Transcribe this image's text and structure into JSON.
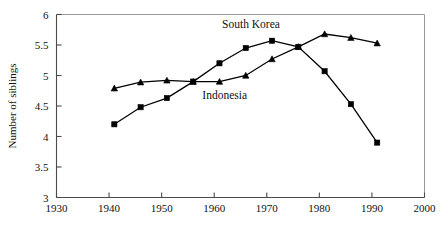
{
  "chart_data": {
    "type": "line",
    "title": "",
    "xlabel": "",
    "ylabel": "Number of siblings",
    "xlim": [
      1930,
      2000
    ],
    "ylim": [
      3,
      6
    ],
    "xticks": [
      1930,
      1940,
      1950,
      1960,
      1970,
      1980,
      1990,
      2000
    ],
    "yticks": [
      3,
      3.5,
      4,
      4.5,
      5,
      5.5,
      6
    ],
    "xtick_labels": [
      "1930",
      "1940",
      "1950",
      "1960",
      "1970",
      "1980",
      "1990",
      "2000"
    ],
    "ytick_labels": [
      "3",
      "3.5",
      "4",
      "4.5",
      "5",
      "5.5",
      "6"
    ],
    "grid": false,
    "legend_position": "inline-annotations",
    "series": [
      {
        "name": "South Korea",
        "marker": "square",
        "label_position": {
          "x": 1967,
          "y": 5.78
        },
        "x": [
          1941,
          1946,
          1951,
          1956,
          1961,
          1966,
          1971,
          1976,
          1981,
          1986,
          1991
        ],
        "y": [
          4.2,
          4.48,
          4.63,
          4.9,
          5.2,
          5.45,
          5.57,
          5.47,
          5.07,
          4.53,
          3.9
        ]
      },
      {
        "name": "Indonesia",
        "marker": "triangle",
        "label_position": {
          "x": 1962,
          "y": 4.62
        },
        "x": [
          1941,
          1946,
          1951,
          1956,
          1961,
          1966,
          1971,
          1976,
          1981,
          1986,
          1991
        ],
        "y": [
          4.79,
          4.89,
          4.92,
          4.9,
          4.9,
          5.0,
          5.27,
          5.47,
          5.68,
          5.62,
          5.53
        ]
      }
    ]
  }
}
